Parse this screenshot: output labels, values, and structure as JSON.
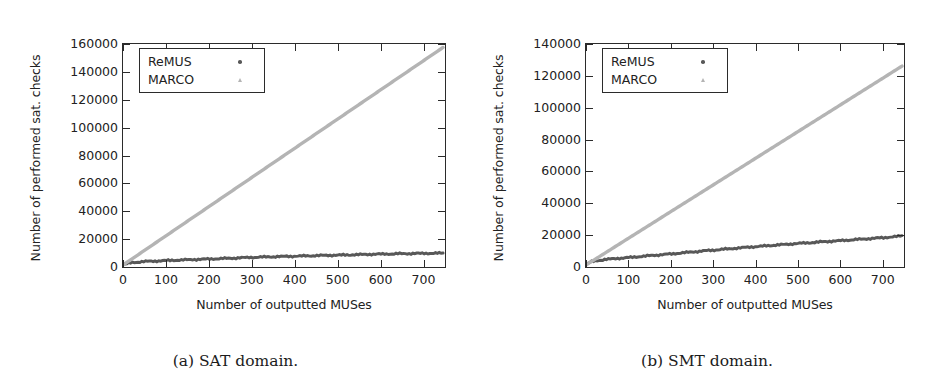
{
  "figure": {
    "panels": [
      {
        "id": "sat",
        "caption": "(a) SAT domain.",
        "xlabel": "Number of outputted MUSes",
        "ylabel": "Number of performed sat. checks",
        "legend": [
          {
            "label": "ReMUS",
            "marker": "dot-marker-icon",
            "color": "#585858"
          },
          {
            "label": "MARCO",
            "marker": "triangle-marker-icon",
            "color": "#b4b4b4"
          }
        ],
        "yticks": [
          "0",
          "20000",
          "40000",
          "60000",
          "80000",
          "100000",
          "120000",
          "140000",
          "160000"
        ],
        "xticks": [
          "0",
          "100",
          "200",
          "300",
          "400",
          "500",
          "600",
          "700"
        ]
      },
      {
        "id": "smt",
        "caption": "(b) SMT domain.",
        "xlabel": "Number of outputted MUSes",
        "ylabel": "Number of performed sat. checks",
        "legend": [
          {
            "label": "ReMUS",
            "marker": "dot-marker-icon",
            "color": "#585858"
          },
          {
            "label": "MARCO",
            "marker": "triangle-marker-icon",
            "color": "#b4b4b4"
          }
        ],
        "yticks": [
          "0",
          "20000",
          "40000",
          "60000",
          "80000",
          "100000",
          "120000",
          "140000"
        ],
        "xticks": [
          "0",
          "100",
          "200",
          "300",
          "400",
          "500",
          "600",
          "700"
        ]
      }
    ]
  },
  "chart_data": [
    {
      "type": "line",
      "title": "(a) SAT domain.",
      "xlabel": "Number of outputted MUSes",
      "ylabel": "Number of performed sat. checks",
      "xlim": [
        0,
        750
      ],
      "ylim": [
        0,
        160000
      ],
      "xticks": [
        0,
        100,
        200,
        300,
        400,
        500,
        600,
        700
      ],
      "yticks": [
        0,
        20000,
        40000,
        60000,
        80000,
        100000,
        120000,
        140000,
        160000
      ],
      "grid": false,
      "legend_position": "upper-left-inside",
      "series": [
        {
          "name": "ReMUS",
          "color": "#585858",
          "marker": "dot",
          "x": [
            0,
            10,
            25,
            50,
            75,
            100,
            150,
            200,
            250,
            300,
            350,
            400,
            450,
            500,
            550,
            600,
            650,
            700,
            750
          ],
          "y": [
            0,
            1100,
            1900,
            2500,
            2900,
            3200,
            3800,
            4300,
            4900,
            5500,
            6000,
            6400,
            6800,
            7100,
            7500,
            7900,
            8200,
            8400,
            8600
          ]
        },
        {
          "name": "MARCO",
          "color": "#b4b4b4",
          "marker": "triangle",
          "x": [
            0,
            50,
            100,
            150,
            200,
            250,
            300,
            350,
            400,
            450,
            500,
            550,
            600,
            650,
            700,
            750
          ],
          "y": [
            0,
            10500,
            21000,
            31500,
            42000,
            52500,
            63000,
            73500,
            84000,
            94500,
            105000,
            115500,
            126000,
            136500,
            147000,
            157500
          ]
        }
      ]
    },
    {
      "type": "line",
      "title": "(b) SMT domain.",
      "xlabel": "Number of outputted MUSes",
      "ylabel": "Number of performed sat. checks",
      "xlim": [
        0,
        750
      ],
      "ylim": [
        0,
        140000
      ],
      "xticks": [
        0,
        100,
        200,
        300,
        400,
        500,
        600,
        700
      ],
      "yticks": [
        0,
        20000,
        40000,
        60000,
        80000,
        100000,
        120000,
        140000
      ],
      "grid": false,
      "legend_position": "upper-left-inside",
      "series": [
        {
          "name": "ReMUS",
          "color": "#585858",
          "marker": "dot",
          "x": [
            0,
            10,
            25,
            50,
            75,
            100,
            150,
            200,
            250,
            300,
            350,
            400,
            450,
            500,
            550,
            600,
            650,
            700,
            740,
            750
          ],
          "y": [
            0,
            1800,
            2800,
            3600,
            4200,
            4700,
            5900,
            7000,
            8200,
            9400,
            10500,
            11600,
            12600,
            13600,
            14500,
            15400,
            16300,
            17200,
            18100,
            18500
          ]
        },
        {
          "name": "MARCO",
          "color": "#b4b4b4",
          "marker": "triangle",
          "x": [
            0,
            50,
            100,
            150,
            200,
            250,
            300,
            350,
            400,
            450,
            500,
            550,
            600,
            650,
            700,
            750
          ],
          "y": [
            0,
            8400,
            16800,
            25200,
            33600,
            42000,
            50400,
            58800,
            67200,
            75600,
            84000,
            92400,
            100800,
            109200,
            117600,
            126000
          ]
        }
      ]
    }
  ]
}
